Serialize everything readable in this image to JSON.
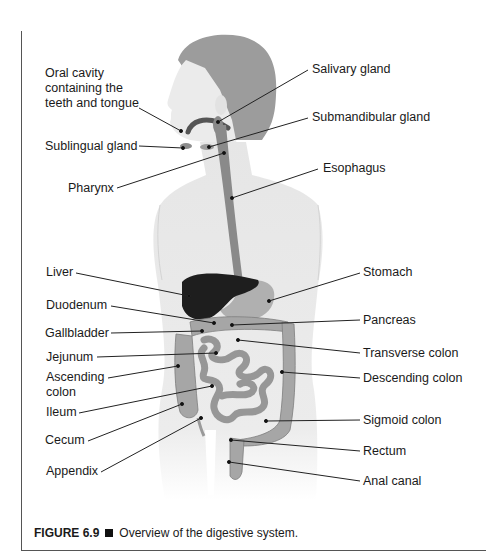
{
  "figure": {
    "number_label": "FIGURE 6.9",
    "caption": "Overview of the digestive system."
  },
  "labels": {
    "left": [
      {
        "id": "oral-cavity",
        "text": "Oral cavity\ncontaining the\nteeth and tongue"
      },
      {
        "id": "sublingual-gland",
        "text": "Sublingual gland"
      },
      {
        "id": "pharynx",
        "text": "Pharynx"
      },
      {
        "id": "liver",
        "text": "Liver"
      },
      {
        "id": "duodenum",
        "text": "Duodenum"
      },
      {
        "id": "gallbladder",
        "text": "Gallbladder"
      },
      {
        "id": "jejunum",
        "text": "Jejunum"
      },
      {
        "id": "ascending-colon",
        "text": "Ascending\ncolon"
      },
      {
        "id": "ileum",
        "text": "Ileum"
      },
      {
        "id": "cecum",
        "text": "Cecum"
      },
      {
        "id": "appendix",
        "text": "Appendix"
      }
    ],
    "right": [
      {
        "id": "salivary-gland",
        "text": "Salivary gland"
      },
      {
        "id": "submandibular-gland",
        "text": "Submandibular gland"
      },
      {
        "id": "esophagus",
        "text": "Esophagus"
      },
      {
        "id": "stomach",
        "text": "Stomach"
      },
      {
        "id": "pancreas",
        "text": "Pancreas"
      },
      {
        "id": "transverse-colon",
        "text": "Transverse colon"
      },
      {
        "id": "descending-colon",
        "text": "Descending colon"
      },
      {
        "id": "sigmoid-colon",
        "text": "Sigmoid colon"
      },
      {
        "id": "rectum",
        "text": "Rectum"
      },
      {
        "id": "anal-canal",
        "text": "Anal canal"
      }
    ]
  },
  "colors": {
    "skin": "#e9e9e9",
    "hair": "#9a9a9a",
    "liver": "#1e1e1e",
    "organ": "#a8a8a8",
    "esophagus": "#8a8a8a",
    "leader_line": "#222222"
  }
}
